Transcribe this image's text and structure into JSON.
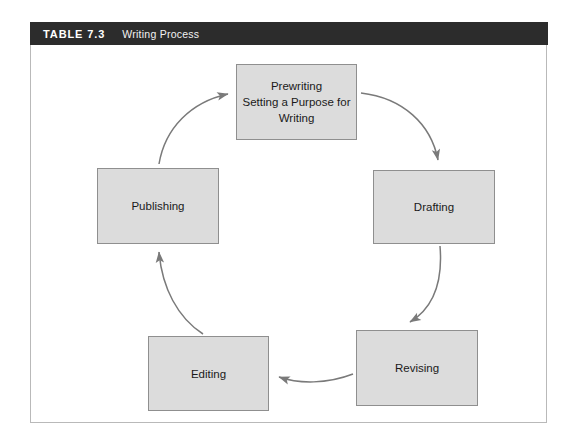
{
  "figure": {
    "table_number": "TABLE 7.3",
    "table_title": "Writing Process",
    "header_background": "#2c2c2c",
    "box_fill": "#dcdcdc",
    "box_border": "#8f8f8f",
    "arrow_color": "#7a7a7a",
    "frame_border": "#b9b9b9"
  },
  "diagram": {
    "type": "cycle",
    "direction": "clockwise",
    "steps": [
      {
        "id": "prewriting",
        "label": "Prewriting\nSetting a Purpose for\nWriting",
        "position": "top"
      },
      {
        "id": "drafting",
        "label": "Drafting",
        "position": "right"
      },
      {
        "id": "revising",
        "label": "Revising",
        "position": "bottom-right"
      },
      {
        "id": "editing",
        "label": "Editing",
        "position": "bottom-left"
      },
      {
        "id": "publishing",
        "label": "Publishing",
        "position": "left"
      }
    ],
    "connections": [
      {
        "from": "prewriting",
        "to": "drafting"
      },
      {
        "from": "drafting",
        "to": "revising"
      },
      {
        "from": "revising",
        "to": "editing"
      },
      {
        "from": "editing",
        "to": "publishing"
      },
      {
        "from": "publishing",
        "to": "prewriting"
      }
    ]
  }
}
